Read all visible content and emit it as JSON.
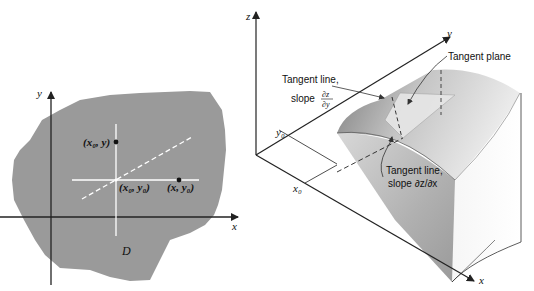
{
  "left_figure": {
    "axis_x_label": "x",
    "axis_y_label": "y",
    "region_label": "D",
    "point_x0_y_label": "(x₀, y)",
    "point_x0_y0_label": "(x₀, y₀)",
    "point_x_y0_label": "(x, y₀)",
    "colors": {
      "region": "#9a9a9a",
      "lines": "#ffffff",
      "axes": "#222222"
    }
  },
  "right_figure": {
    "axis_x_label": "x",
    "axis_y_label": "y",
    "axis_z_label": "z",
    "x0_label": "x₀",
    "y0_label": "y₀",
    "tangent_plane_label": "Tangent plane",
    "tangent_line_y_label_1": "Tangent line,",
    "tangent_line_y_label_2": "slope",
    "tangent_line_y_slope_num": "∂z",
    "tangent_line_y_slope_den": "∂y",
    "tangent_line_x_label_1": "Tangent line,",
    "tangent_line_x_label_2": "slope ∂z/∂x"
  }
}
